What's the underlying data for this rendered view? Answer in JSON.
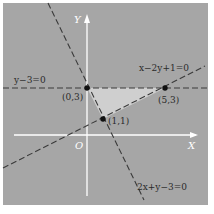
{
  "diagram": {
    "type": "linear-programming-feasible-region",
    "axes": {
      "x_label": "X",
      "y_label": "Y",
      "origin_label": "O"
    },
    "lines": [
      {
        "equation": "y − 3 = 0",
        "label": "y−3=0"
      },
      {
        "equation": "x − 2y + 1 = 0",
        "label": "x−2y+1=0"
      },
      {
        "equation": "2x + y − 3 = 0",
        "label": "2x+y−3=0"
      }
    ],
    "points": [
      {
        "label": "(0,3)",
        "x": 0,
        "y": 3
      },
      {
        "label": "(5,3)",
        "x": 5,
        "y": 3
      },
      {
        "label": "(1,1)",
        "x": 1,
        "y": 1
      }
    ],
    "region": {
      "vertices": [
        "(0,3)",
        "(5,3)",
        "(1,1)"
      ],
      "fill": "#cfcfcf"
    },
    "colors": {
      "background": "#a6a6a6",
      "axes": "#ffffff",
      "lines": "#3a3a3a"
    }
  }
}
